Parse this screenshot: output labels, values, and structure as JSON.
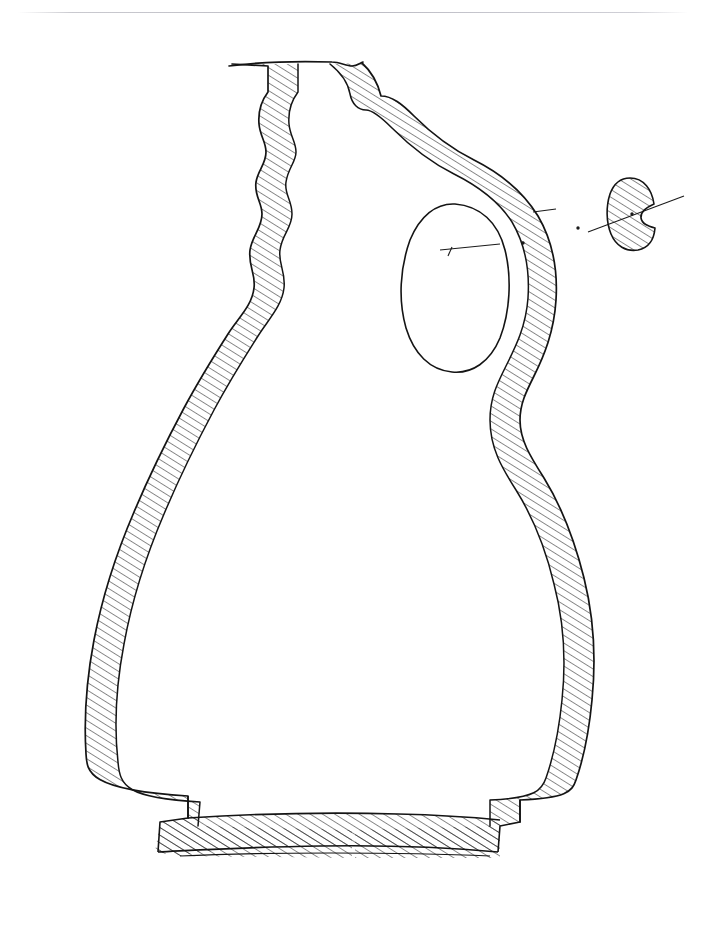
{
  "page": {
    "width": 704,
    "height": 928,
    "background_color": "#ffffff",
    "ink_color": "#1a1a1a",
    "header_rule_color": "#bcbcc4",
    "faint_header_text": "",
    "caption": ""
  },
  "figure": {
    "title": "",
    "type": "archaeological-vessel-section-drawing",
    "orientation": "section half at left, exterior profile at right",
    "hatching": {
      "style": "diagonal parallel lines",
      "angle_degrees": 58,
      "spacing_px": 6.5,
      "stroke_width_px": 1.0,
      "color": "#1a1a1a"
    },
    "outline": {
      "stroke_width_px": 1.6,
      "color": "#141414"
    },
    "parts": [
      {
        "name": "rim",
        "label": "rim",
        "top_y": 63,
        "left_x": 228,
        "right_x": 362,
        "note": "plain everted rim, slightly uneven hand-drawn top edge"
      },
      {
        "name": "neck",
        "label": "neck",
        "top_y": 63,
        "bottom_y": 300,
        "note": "tall cylindrical neck, wall thickness approx 36 px on left, wavy interior face"
      },
      {
        "name": "shoulder",
        "label": "shoulder",
        "top_y": 300,
        "bottom_y": 470
      },
      {
        "name": "body",
        "label": "body",
        "widest_y": 620,
        "left_x": 44,
        "right_x": 596,
        "note": "broad ovoid body, thin hatched wall band"
      },
      {
        "name": "base",
        "label": "base",
        "top_y": 818,
        "bottom_y": 861,
        "left_x": 155,
        "right_x": 500,
        "note": "flat thick base slab with slight footring step at each edge"
      },
      {
        "name": "handle",
        "label": "handle",
        "top_y": 110,
        "bottom_y": 430,
        "outer_x": 560,
        "note": "vertical loop handle from upper neck to shoulder, enclosing an ovoid void"
      },
      {
        "name": "handle-void",
        "label": "handle opening",
        "left_x": 405,
        "right_x": 505,
        "top_y": 205,
        "bottom_y": 370
      }
    ],
    "handle_section_detail": {
      "name": "handle-section",
      "label": "",
      "shape": "kidney / bean-shaped, fully hatched",
      "center_x": 632,
      "center_y": 214,
      "width_px": 48,
      "height_px": 72,
      "fully_hatched": true,
      "center_dot": true
    },
    "section_indicator": {
      "name": "section-line",
      "style": "dash-dot leader",
      "from_x": 452,
      "from_y": 247,
      "to_x": 610,
      "to_y": 212,
      "dots": [
        {
          "x": 523,
          "y": 243
        },
        {
          "x": 578,
          "y": 228
        }
      ],
      "note": "dash-dot line linking the handle on the profile to its cross-section at right"
    },
    "scale_bar": null
  }
}
